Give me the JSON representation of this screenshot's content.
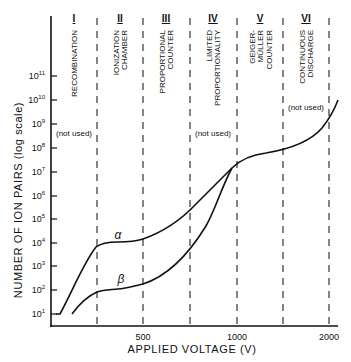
{
  "chart_data": {
    "type": "line",
    "title": "",
    "xlabel": "APPLIED VOLTAGE (V)",
    "ylabel": "NUMBER OF ION PAIRS (log scale)",
    "x_ticks": [
      {
        "label": "500",
        "x": 143
      },
      {
        "label": "1000",
        "x": 237
      },
      {
        "label": "2000",
        "x": 329
      }
    ],
    "y_ticks": [
      {
        "base": "10",
        "exp": "1",
        "y": 314
      },
      {
        "base": "10",
        "exp": "2",
        "y": 290
      },
      {
        "base": "10",
        "exp": "3",
        "y": 266
      },
      {
        "base": "10",
        "exp": "4",
        "y": 243
      },
      {
        "base": "10",
        "exp": "5",
        "y": 219
      },
      {
        "base": "10",
        "exp": "6",
        "y": 196
      },
      {
        "base": "10",
        "exp": "7",
        "y": 172
      },
      {
        "base": "10",
        "exp": "8",
        "y": 148
      },
      {
        "base": "10",
        "exp": "9",
        "y": 124
      },
      {
        "base": "10",
        "exp": "10",
        "y": 100
      },
      {
        "base": "10",
        "exp": "11",
        "y": 76
      }
    ],
    "ylim": [
      10,
      100000000000
    ],
    "regions": [
      {
        "numeral": "I",
        "lines": [
          "RECOMBINATION"
        ],
        "x_center": 74
      },
      {
        "numeral": "II",
        "lines": [
          "IONIZATION",
          "CHAMBER"
        ],
        "x_center": 120
      },
      {
        "numeral": "III",
        "lines": [
          "PROPORTIONAL",
          "COUNTER"
        ],
        "x_center": 166
      },
      {
        "numeral": "IV",
        "lines": [
          "LIMITED",
          "PROPORTIONALITY"
        ],
        "x_center": 213
      },
      {
        "numeral": "V",
        "lines": [
          "GEIGER-",
          "MÜLLER",
          "COUNTER"
        ],
        "x_center": 260
      },
      {
        "numeral": "VI",
        "lines": [
          "CONTINUOUS",
          "DISCHARGE"
        ],
        "x_center": 306
      }
    ],
    "region_boundaries_x": [
      97,
      143,
      190,
      237,
      283,
      329
    ],
    "annotations": [
      {
        "text": "(not used)",
        "x": 74,
        "y": 136
      },
      {
        "text": "(not used)",
        "x": 213,
        "y": 136
      },
      {
        "text": "(not used)",
        "x": 306,
        "y": 110
      }
    ],
    "series": [
      {
        "name": "α",
        "label": "α",
        "description": "alpha particles",
        "points_log10": [
          {
            "region": "I start",
            "value": 1
          },
          {
            "region": "I/II boundary",
            "value": 3.8
          },
          {
            "region": "II plateau",
            "value": 3.9
          },
          {
            "region": "II/III boundary",
            "value": 4.0
          },
          {
            "region": "III/IV boundary",
            "value": 5.5
          },
          {
            "region": "IV/V boundary",
            "value": 7.5
          },
          {
            "region": "V plateau",
            "value": 7.9
          },
          {
            "region": "VI end",
            "value": 9.8
          }
        ]
      },
      {
        "name": "β",
        "label": "β",
        "description": "beta particles",
        "points_log10": [
          {
            "region": "I start",
            "value": 1
          },
          {
            "region": "I/II boundary",
            "value": 1.9
          },
          {
            "region": "II plateau",
            "value": 2.1
          },
          {
            "region": "II/III boundary",
            "value": 2.3
          },
          {
            "region": "III/IV boundary",
            "value": 4.3
          },
          {
            "region": "IV/V boundary",
            "value": 7.5
          },
          {
            "region": "V plateau",
            "value": 7.9
          },
          {
            "region": "VI end",
            "value": 9.8
          }
        ]
      }
    ],
    "grid": false,
    "legend": "inline curve labels"
  },
  "labels": {
    "alpha": "α",
    "beta": "β"
  }
}
